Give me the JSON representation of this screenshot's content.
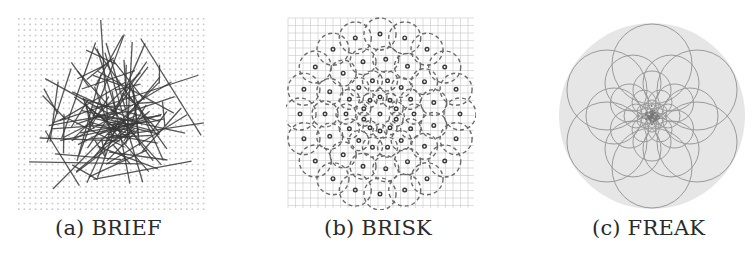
{
  "figure": {
    "panels": [
      {
        "id": "a",
        "caption": "(a) BRIEF",
        "pattern": "random-pairs-on-grid"
      },
      {
        "id": "b",
        "caption": "(b) BRISK",
        "pattern": "concentric-rings-of-dashed-circles"
      },
      {
        "id": "c",
        "caption": "(c) FREAK",
        "pattern": "retina-overlapping-circles"
      }
    ],
    "colors": {
      "line": "#3a3a3a",
      "grid": "#c8c8c8",
      "dashed": "#6a6a6a",
      "freak_disc": "#e6e6e6",
      "freak_circle": "#9a9a9a",
      "caption": "#2a2a2a"
    }
  }
}
